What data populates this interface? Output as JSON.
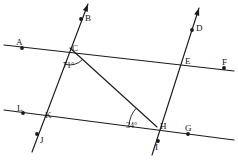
{
  "figure": {
    "type": "geometry-diagram",
    "width": 238,
    "height": 164,
    "stroke_color": "#1a1a1a",
    "background_color": "#ffffff",
    "points": [
      {
        "id": "A",
        "label": "A",
        "x": 22,
        "y": 48,
        "label_x": 16,
        "label_y": 38,
        "dot": true
      },
      {
        "id": "B",
        "label": "B",
        "x": 81,
        "y": 19,
        "label_x": 85,
        "label_y": 14,
        "dot": true
      },
      {
        "id": "C",
        "label": "C",
        "x": 70,
        "y": 48,
        "label_x": 72,
        "label_y": 44,
        "dot": false
      },
      {
        "id": "D",
        "label": "D",
        "x": 192,
        "y": 30,
        "label_x": 196,
        "label_y": 24,
        "dot": true
      },
      {
        "id": "E",
        "label": "E",
        "x": 182,
        "y": 62,
        "label_x": 185,
        "label_y": 57,
        "dot": false
      },
      {
        "id": "F",
        "label": "F",
        "x": 224,
        "y": 68,
        "label_x": 222,
        "label_y": 58,
        "dot": true
      },
      {
        "id": "G",
        "label": "G",
        "x": 188,
        "y": 134,
        "label_x": 185,
        "label_y": 124,
        "dot": true
      },
      {
        "id": "H",
        "label": "H",
        "x": 157,
        "y": 127,
        "label_x": 160,
        "label_y": 122,
        "dot": false
      },
      {
        "id": "I",
        "label": "I",
        "x": 158,
        "y": 141,
        "label_x": 155,
        "label_y": 143,
        "dot": true
      },
      {
        "id": "J",
        "label": "J",
        "x": 37,
        "y": 134,
        "label_x": 40,
        "label_y": 136,
        "dot": true
      },
      {
        "id": "K",
        "label": "K",
        "x": 42,
        "y": 116,
        "label_x": 45,
        "label_y": 111,
        "dot": false
      },
      {
        "id": "L",
        "label": "L",
        "x": 23,
        "y": 113,
        "label_x": 17,
        "label_y": 104,
        "dot": true
      }
    ],
    "lines": [
      {
        "name": "line-AF-upper-horizontal",
        "from": [
          4,
          45
        ],
        "to": [
          234,
          71
        ],
        "arrow_start": false,
        "arrow_end": false
      },
      {
        "name": "line-LG-lower-horizontal",
        "from": [
          4,
          110
        ],
        "to": [
          234,
          140
        ],
        "arrow_start": false,
        "arrow_end": false
      },
      {
        "name": "line-BJ-left-transversal",
        "from": [
          88,
          4
        ],
        "to": [
          32,
          152
        ],
        "arrow_start": true,
        "arrow_end": false
      },
      {
        "name": "line-DI-right-transversal",
        "from": [
          199,
          8
        ],
        "to": [
          152,
          155
        ],
        "arrow_start": true,
        "arrow_end": false
      },
      {
        "name": "segment-CH-diagonal",
        "from": [
          70,
          48
        ],
        "to": [
          157,
          127
        ],
        "arrow_start": false,
        "arrow_end": false
      }
    ],
    "angles": [
      {
        "id": "angle-at-C",
        "value": "71°",
        "vertex": "C",
        "label_x": 63,
        "label_y": 62,
        "arc_cx": 70,
        "arc_cy": 48,
        "arc_r": 17,
        "arc_start_deg": 42,
        "arc_end_deg": 110
      },
      {
        "id": "angle-at-H",
        "value": "34°",
        "vertex": "H",
        "label_x": 126,
        "label_y": 122,
        "arc_cx": 157,
        "arc_cy": 127,
        "arc_r": 28,
        "arc_start_deg": 185,
        "arc_end_deg": 222
      }
    ]
  },
  "footer": {
    "cropped_text_note": "",
    "fragments": [
      {
        "text": "",
        "x": 8,
        "y": 157
      },
      {
        "text": "",
        "x": 96,
        "y": 157
      },
      {
        "text": "",
        "x": 190,
        "y": 157
      }
    ]
  }
}
